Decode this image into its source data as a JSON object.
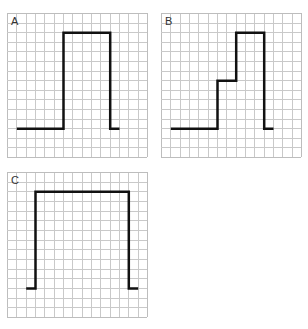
{
  "grid": {
    "cols": 15,
    "rows": 15,
    "line_color": "#c9c9c9",
    "border_color": "#bdbdbd",
    "trace_color": "#111111"
  },
  "panels": [
    {
      "label": "A",
      "x": 7,
      "y": 13,
      "width": 140,
      "height": 144,
      "points": [
        [
          1,
          12
        ],
        [
          6,
          12
        ],
        [
          6,
          2
        ],
        [
          11,
          2
        ],
        [
          11,
          12
        ],
        [
          12,
          12
        ]
      ]
    },
    {
      "label": "B",
      "x": 161,
      "y": 13,
      "width": 140,
      "height": 144,
      "points": [
        [
          1,
          12
        ],
        [
          6,
          12
        ],
        [
          6,
          7
        ],
        [
          8,
          7
        ],
        [
          8,
          2
        ],
        [
          11,
          2
        ],
        [
          11,
          12
        ],
        [
          12,
          12
        ]
      ]
    },
    {
      "label": "C",
      "x": 7,
      "y": 172,
      "width": 140,
      "height": 145,
      "points": [
        [
          2,
          12
        ],
        [
          3,
          12
        ],
        [
          3,
          2
        ],
        [
          13,
          2
        ],
        [
          13,
          12
        ],
        [
          14,
          12
        ]
      ]
    }
  ]
}
